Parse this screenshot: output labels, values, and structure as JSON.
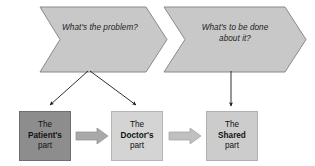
{
  "diagram": {
    "colors": {
      "chevron_fill": "#c8c8c8",
      "chevron_stroke": "#8a8a8a",
      "box_dark_fill": "#8d8d8d",
      "box_mid_fill": "#d4d4d4",
      "box_light_fill": "#cccccc",
      "block_arrow_fill": "#a9a9a9",
      "block_arrow_stroke": "#8d8d8d",
      "connector_stroke": "#1a1a1a",
      "text_color": "#111111",
      "background": "#ffffff"
    },
    "chevrons": [
      {
        "id": "chevron-1",
        "label": "What's the problem?",
        "line_1": "What's the",
        "line_2": "problem?"
      },
      {
        "id": "chevron-2",
        "label": "What's to be done about it?",
        "line_1": "What's to be",
        "line_2": "done about it?"
      }
    ],
    "boxes": [
      {
        "id": "stage-box-patient",
        "label": "The Patient's part",
        "line_1": "The",
        "line_2": "Patient's",
        "line_3": "part"
      },
      {
        "id": "stage-box-doctor",
        "label": "The Doctor's part",
        "line_1": "The",
        "line_2": "Doctor's",
        "line_3": "part"
      },
      {
        "id": "stage-box-shared",
        "label": "The Shared part",
        "line_1": "The",
        "line_2": "Shared",
        "line_3": "part"
      }
    ],
    "connectors": [
      {
        "id": "connector-problem-to-patient",
        "from": "chevron-1",
        "to": "stage-box-patient",
        "style": "diagonal-arrow"
      },
      {
        "id": "connector-problem-to-doctor",
        "from": "chevron-1",
        "to": "stage-box-doctor",
        "style": "diagonal-arrow"
      },
      {
        "id": "connector-plan-to-shared",
        "from": "chevron-2",
        "to": "stage-box-shared",
        "style": "vertical-arrow"
      }
    ],
    "flow_arrows": [
      {
        "id": "flow-arrow-patient-to-doctor",
        "from": "stage-box-patient",
        "to": "stage-box-doctor",
        "style": "block-arrow-right"
      },
      {
        "id": "flow-arrow-doctor-to-shared",
        "from": "stage-box-doctor",
        "to": "stage-box-shared",
        "style": "block-arrow-right"
      }
    ]
  }
}
